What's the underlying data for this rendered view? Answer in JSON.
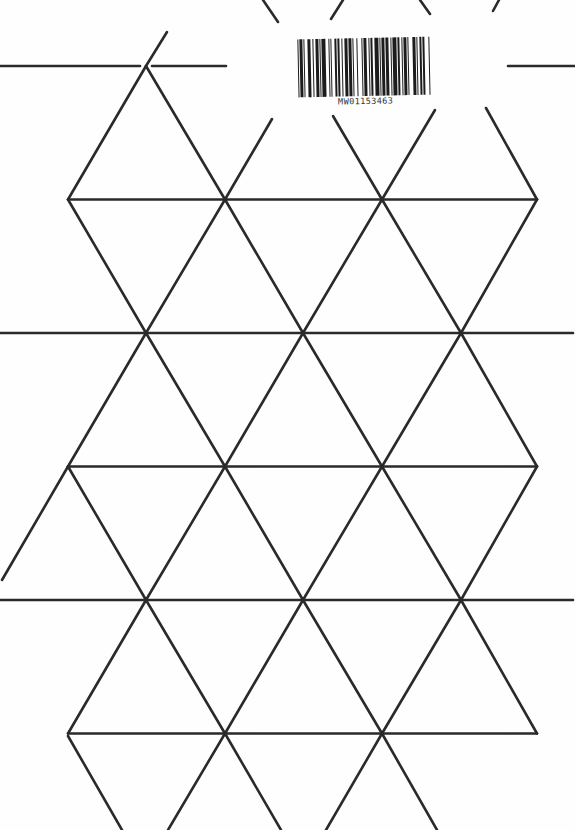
{
  "page": {
    "background": "#fefefe",
    "line_color": "#2a2a2a",
    "line_width": 2.6
  },
  "barcode": {
    "text": "MW01153463",
    "pattern": [
      1,
      1,
      2,
      1,
      1,
      2,
      3,
      1,
      1,
      2,
      2,
      1,
      1,
      1,
      3,
      2,
      1,
      1,
      1,
      2,
      2,
      1,
      1,
      2,
      1,
      1,
      3,
      1,
      2,
      1,
      1,
      2,
      1,
      3,
      1,
      1,
      2,
      2,
      1,
      1,
      1,
      2,
      3,
      1,
      1,
      1,
      2,
      1,
      2,
      2,
      1,
      1,
      3,
      1,
      1,
      2,
      1,
      1,
      2,
      1,
      1,
      3,
      2,
      1,
      1,
      2,
      1,
      1,
      2,
      3,
      1,
      1
    ]
  },
  "grid": {
    "description": "Equilateral triangle template (hexaflexagon-style)",
    "full_rows_y": [
      66,
      333,
      600
    ],
    "short_rows_y": [
      199.5,
      466.5,
      733.5
    ],
    "full_row_vertices_x": [
      146,
      303,
      461
    ],
    "short_row_vertices_x": [
      68,
      225,
      382,
      537
    ],
    "segments": [
      [
        0,
        66,
        140,
        66
      ],
      [
        152,
        66,
        226,
        66
      ],
      [
        508,
        66,
        575,
        66
      ],
      [
        68,
        199.5,
        537,
        199.5
      ],
      [
        0,
        333,
        573,
        333
      ],
      [
        68,
        466.5,
        537,
        466.5
      ],
      [
        0,
        600,
        573,
        600
      ],
      [
        68,
        733.5,
        537,
        733.5
      ],
      [
        146,
        66,
        68,
        199.5
      ],
      [
        146,
        66,
        225,
        199.5
      ],
      [
        225,
        199.5,
        272,
        119
      ],
      [
        382,
        199.5,
        333,
        116
      ],
      [
        382,
        199.5,
        435,
        110
      ],
      [
        537,
        199.5,
        486,
        108
      ],
      [
        146,
        66,
        167,
        32
      ],
      [
        263,
        0,
        278,
        22
      ],
      [
        343,
        0,
        331,
        19
      ],
      [
        420,
        0,
        430,
        14
      ],
      [
        499,
        0,
        493,
        11
      ],
      [
        68,
        199.5,
        146,
        333
      ],
      [
        225,
        199.5,
        146,
        333
      ],
      [
        225,
        199.5,
        303,
        333
      ],
      [
        382,
        199.5,
        303,
        333
      ],
      [
        382,
        199.5,
        461,
        333
      ],
      [
        537,
        199.5,
        461,
        333
      ],
      [
        146,
        333,
        68,
        466.5
      ],
      [
        146,
        333,
        225,
        466.5
      ],
      [
        303,
        333,
        225,
        466.5
      ],
      [
        303,
        333,
        382,
        466.5
      ],
      [
        461,
        333,
        382,
        466.5
      ],
      [
        461,
        333,
        537,
        466.5
      ],
      [
        68,
        466.5,
        146,
        600
      ],
      [
        225,
        466.5,
        146,
        600
      ],
      [
        225,
        466.5,
        303,
        600
      ],
      [
        382,
        466.5,
        303,
        600
      ],
      [
        382,
        466.5,
        461,
        600
      ],
      [
        537,
        466.5,
        461,
        600
      ],
      [
        68,
        466.5,
        2,
        580
      ],
      [
        146,
        600,
        68,
        733.5
      ],
      [
        146,
        600,
        225,
        733.5
      ],
      [
        303,
        600,
        225,
        733.5
      ],
      [
        303,
        600,
        382,
        733.5
      ],
      [
        461,
        600,
        382,
        733.5
      ],
      [
        461,
        600,
        537,
        733.5
      ],
      [
        68,
        736,
        122,
        830
      ],
      [
        225,
        733.5,
        168,
        830
      ],
      [
        225,
        733.5,
        281,
        830
      ],
      [
        382,
        733.5,
        326,
        830
      ],
      [
        382,
        733.5,
        437,
        830
      ]
    ]
  }
}
